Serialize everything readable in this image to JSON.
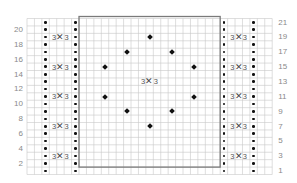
{
  "chart": {
    "cols": 33,
    "rows": 21,
    "cell": 7.43,
    "origin": [
      27,
      18.5
    ],
    "grid_color": "#c8c8c8",
    "border_color": "#7a7a7a",
    "thick_box": {
      "col_start": 7,
      "col_end": 26,
      "row_top": 21,
      "row_bottom": 2
    },
    "left_row_numbers": [
      "20",
      "18",
      "16",
      "14",
      "12",
      "10",
      "8",
      "6",
      "4",
      "2"
    ],
    "right_row_numbers": [
      "21",
      "19",
      "17",
      "15",
      "13",
      "11",
      "9",
      "7",
      "5",
      "3",
      "1"
    ],
    "purl_columns": [
      2,
      6,
      26,
      30
    ],
    "cable_label": {
      "left": "3",
      "cross": "✕",
      "right": "3"
    },
    "side_cable_rows": [
      19,
      15,
      11,
      7,
      3
    ],
    "center_cable_row": 13,
    "diamonds": [
      {
        "col": 16,
        "row": 19
      },
      {
        "col": 13,
        "row": 17
      },
      {
        "col": 19,
        "row": 17
      },
      {
        "col": 10,
        "row": 15
      },
      {
        "col": 22,
        "row": 15
      },
      {
        "col": 10,
        "row": 11
      },
      {
        "col": 22,
        "row": 11
      },
      {
        "col": 13,
        "row": 9
      },
      {
        "col": 19,
        "row": 9
      },
      {
        "col": 16,
        "row": 7
      }
    ]
  }
}
